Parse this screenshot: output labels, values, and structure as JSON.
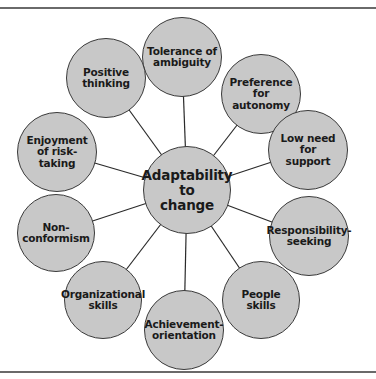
{
  "diagram": {
    "type": "radial-hub-and-spoke",
    "center": {
      "label": "Adaptability\nto\nchange",
      "x": 187,
      "y": 190,
      "r": 44
    },
    "nodes": [
      {
        "id": "tolerance",
        "label": "Tolerance of\nambiguity",
        "x": 182,
        "y": 57,
        "r": 40
      },
      {
        "id": "preference",
        "label": "Preference for\nautonomy",
        "x": 261,
        "y": 94,
        "r": 40
      },
      {
        "id": "low-need",
        "label": "Low need\nfor\nsupport",
        "x": 308,
        "y": 150,
        "r": 40
      },
      {
        "id": "responsibility",
        "label": "Responsibility-\nseeking",
        "x": 309,
        "y": 236,
        "r": 40
      },
      {
        "id": "people",
        "label": "People\nskills",
        "x": 261,
        "y": 300,
        "r": 39
      },
      {
        "id": "achievement",
        "label": "Achievement-\norientation",
        "x": 184,
        "y": 330,
        "r": 40
      },
      {
        "id": "organizational",
        "label": "Organizational\nskills",
        "x": 103,
        "y": 300,
        "r": 39
      },
      {
        "id": "non-conformism",
        "label": "Non-\nconformism",
        "x": 56,
        "y": 233,
        "r": 39
      },
      {
        "id": "enjoyment",
        "label": "Enjoyment\nof risk-\ntaking",
        "x": 57,
        "y": 152,
        "r": 40
      },
      {
        "id": "positive",
        "label": "Positive\nthinking",
        "x": 106,
        "y": 78,
        "r": 40
      }
    ],
    "colors": {
      "node_fill": "#c8c8c8",
      "node_stroke": "#3a3a3a",
      "connector": "#2a2a2a",
      "rule": "#6a6a6a"
    }
  }
}
